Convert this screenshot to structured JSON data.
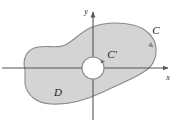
{
  "figure": {
    "type": "math-diagram",
    "labels": {
      "region": "D",
      "outer_curve": "C",
      "inner_curve": "C′",
      "x_axis": "x",
      "y_axis": "y"
    },
    "colors": {
      "region_fill": "#d4d4d4",
      "region_stroke": "#8a8a8a",
      "axis": "#555555",
      "label": "#1a1a1a",
      "background": "#ffffff",
      "hole_fill": "#ffffff"
    },
    "geometry": {
      "origin": {
        "x": 93,
        "y": 68
      },
      "x_axis": {
        "x1": 2,
        "y1": 68,
        "x2": 171,
        "y2": 68
      },
      "y_axis": {
        "x1": 93,
        "y1": 120,
        "x2": 93,
        "y2": 9
      },
      "hole": {
        "cx": 93,
        "cy": 68,
        "r": 11
      },
      "label_positions": {
        "region": {
          "x": 58,
          "y": 96
        },
        "outer_curve": {
          "x": 156,
          "y": 34
        },
        "inner_curve": {
          "x": 110,
          "y": 58
        },
        "x_axis": {
          "x": 168,
          "y": 80
        },
        "y_axis": {
          "x": 86,
          "y": 13
        }
      }
    }
  }
}
